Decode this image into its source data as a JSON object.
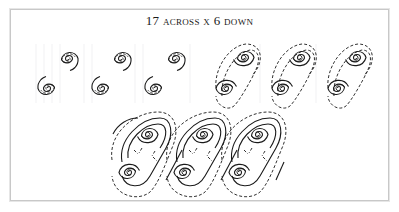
{
  "title": {
    "count": "17",
    "across_label": "across",
    "separator": "x",
    "down_count": "6",
    "down_label": "down",
    "full_text": "17 across x 6 down"
  },
  "diagram": {
    "groups": [
      {
        "name": "step-1-single-spirals",
        "spiral_count": 6,
        "style": "solid spiral with dashed inner line"
      },
      {
        "name": "step-2-paired-spirals-with-dashed-s-curves",
        "spiral_count": 6,
        "style": "solid spirals linked by dashed S-curves"
      },
      {
        "name": "step-3-completed-interlocking-spiral-border",
        "spiral_count": 6,
        "style": "solid S-curve outlines with dashed outer contour"
      }
    ],
    "colors": {
      "line": "#1a1a1a",
      "border": "#c8c8c8",
      "background": "#ffffff"
    }
  }
}
